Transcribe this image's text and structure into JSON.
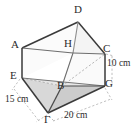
{
  "figure": {
    "background_color": "#ffffff",
    "stroke_color": "#3a3a3a",
    "dashed_color": "#9a9a9a",
    "face_fill_light": "#f2f2f2",
    "face_fill_mid": "#e2e2e2",
    "face_fill_dark": "#cfcfcf",
    "vertices": [
      {
        "id": "A",
        "label": "A",
        "x": 22,
        "y": 48,
        "label_x": 11,
        "label_y": 39
      },
      {
        "id": "D",
        "label": "D",
        "x": 78,
        "y": 22,
        "label_x": 74,
        "label_y": 5
      },
      {
        "id": "H",
        "label": "H",
        "x": 73,
        "y": 53,
        "label_x": 64,
        "label_y": 38
      },
      {
        "id": "C",
        "label": "C",
        "x": 105,
        "y": 54,
        "label_x": 103,
        "label_y": 44
      },
      {
        "id": "E",
        "label": "E",
        "x": 22,
        "y": 78,
        "label_x": 10,
        "label_y": 70
      },
      {
        "id": "B",
        "label": "B",
        "x": 62,
        "y": 86,
        "label_x": 57,
        "label_y": 79
      },
      {
        "id": "G",
        "label": "G",
        "x": 105,
        "y": 86,
        "label_x": 105,
        "label_y": 77
      },
      {
        "id": "GAMMA",
        "label": "Γ",
        "x": 48,
        "y": 113,
        "label_x": 44,
        "label_y": 114
      }
    ],
    "dimensions": [
      {
        "id": "height-right",
        "value": "10 cm",
        "label_x": 107,
        "label_y": 57,
        "edge": "C-G"
      },
      {
        "id": "depth-left",
        "value": "15 cm",
        "label_x": 6,
        "label_y": 94,
        "edge": "E-Γ"
      },
      {
        "id": "width-bottom",
        "value": "20 cm",
        "label_x": 66,
        "label_y": 109,
        "edge": "Γ-G"
      }
    ]
  }
}
